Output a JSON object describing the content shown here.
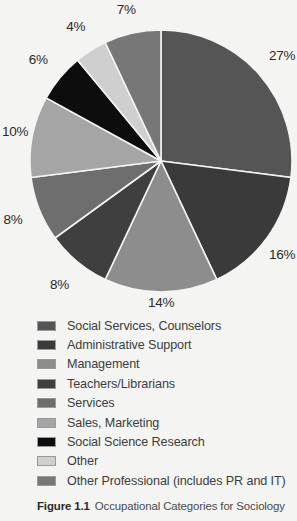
{
  "figure": {
    "caption_label": "Figure 1.1",
    "caption_text": "Occupational Categories for Sociology",
    "background_color": "#f4f4f2"
  },
  "chart_data": {
    "type": "pie",
    "title": "Occupational Categories for Sociology",
    "start_angle_deg": 0,
    "direction": "clockwise",
    "total": 100,
    "unit": "%",
    "legend_position": "bottom",
    "grid": false,
    "categories": [
      "Social Services, Counselors",
      "Administrative Support",
      "Management",
      "Teachers/Librarians",
      "Services",
      "Sales, Marketing",
      "Social Science Research",
      "Other",
      "Other Professional (includes PR and IT)"
    ],
    "values": [
      27,
      16,
      14,
      8,
      8,
      10,
      6,
      4,
      7
    ],
    "labels": [
      "27%",
      "16%",
      "14%",
      "8%",
      "8%",
      "10%",
      "6%",
      "4%",
      "7%"
    ],
    "colors": [
      "#555555",
      "#3a3a3a",
      "#8d8d8d",
      "#3f3f3f",
      "#6e6e6e",
      "#a5a5a5",
      "#0d0d0d",
      "#cfcfcf",
      "#777777"
    ],
    "slices": [
      {
        "label": "Social Services, Counselors",
        "value": 27,
        "display": "27%",
        "color": "#555555",
        "swatch_color": "#555555"
      },
      {
        "label": "Administrative Support",
        "value": 16,
        "display": "16%",
        "color": "#3a3a3a",
        "swatch_color": "#3a3a3a"
      },
      {
        "label": "Management",
        "value": 14,
        "display": "14%",
        "color": "#8d8d8d",
        "swatch_color": "#8d8d8d"
      },
      {
        "label": "Teachers/Librarians",
        "value": 8,
        "display": "8%",
        "color": "#3f3f3f",
        "swatch_color": "#3f3f3f"
      },
      {
        "label": "Services",
        "value": 8,
        "display": "8%",
        "color": "#6e6e6e",
        "swatch_color": "#6e6e6e"
      },
      {
        "label": "Sales, Marketing",
        "value": 10,
        "display": "10%",
        "color": "#a5a5a5",
        "swatch_color": "#a5a5a5"
      },
      {
        "label": "Social Science Research",
        "value": 6,
        "display": "6%",
        "color": "#0d0d0d",
        "swatch_color": "#0d0d0d"
      },
      {
        "label": "Other",
        "value": 4,
        "display": "4%",
        "color": "#cfcfcf",
        "swatch_color": "#cfcfcf"
      },
      {
        "label": "Other Professional (includes PR and IT)",
        "value": 7,
        "display": "7%",
        "color": "#777777",
        "swatch_color": "#777777"
      }
    ]
  }
}
